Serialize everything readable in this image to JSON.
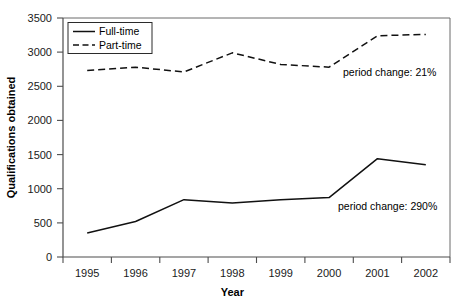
{
  "chart_data": {
    "type": "line",
    "title": "",
    "xlabel": "Year",
    "ylabel": "Qualifications obtained",
    "categories": [
      "1995",
      "1996",
      "1997",
      "1998",
      "1999",
      "2000",
      "2001",
      "2002"
    ],
    "series": [
      {
        "name": "Full-time",
        "style": "solid",
        "color": "#111111",
        "values": [
          350,
          520,
          840,
          790,
          840,
          870,
          1440,
          1350
        ]
      },
      {
        "name": "Part-time",
        "style": "dashed",
        "color": "#111111",
        "values": [
          2730,
          2780,
          2710,
          2990,
          2820,
          2780,
          3240,
          3260
        ]
      }
    ],
    "ylim": [
      0,
      3500
    ],
    "yticks": [
      0,
      500,
      1000,
      1500,
      2000,
      2500,
      3000,
      3500
    ],
    "ytick_labels": [
      "0",
      "500",
      "1000",
      "1500",
      "2000",
      "2500",
      "3000",
      "3500"
    ],
    "grid": false,
    "legend_position": "top-left",
    "legend_entries": [
      "Full-time",
      "Part-time"
    ],
    "annotations": [
      {
        "text": "period change: 21%",
        "series": "Part-time",
        "x_value": 2000.2,
        "y_value": 2640
      },
      {
        "text": "period change: 290%",
        "series": "Full-time",
        "x_value": 2000.2,
        "y_value": 740
      }
    ]
  },
  "axes": {
    "y_axis_title": "Qualifications obtained",
    "x_axis_title": "Year"
  },
  "legend": {
    "items": [
      {
        "label": "Full-time",
        "line_style": "solid"
      },
      {
        "label": "Part-time",
        "line_style": "dashed"
      }
    ]
  },
  "annotations": {
    "part_time_note": "period change: 21%",
    "full_time_note": "period change: 290%"
  },
  "ticks": {
    "y": [
      "0",
      "500",
      "1000",
      "1500",
      "2000",
      "2500",
      "3000",
      "3500"
    ],
    "x": [
      "1995",
      "1996",
      "1997",
      "1998",
      "1999",
      "2000",
      "2001",
      "2002"
    ]
  }
}
